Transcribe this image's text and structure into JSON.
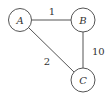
{
  "graph": {
    "nodes": [
      {
        "id": "A",
        "label": "A",
        "cx": 20,
        "cy": 20
      },
      {
        "id": "B",
        "label": "B",
        "cx": 83,
        "cy": 20
      },
      {
        "id": "C",
        "label": "C",
        "cx": 83,
        "cy": 80
      }
    ],
    "edges": [
      {
        "from": "A",
        "to": "B",
        "weight": "1"
      },
      {
        "from": "A",
        "to": "C",
        "weight": "2"
      },
      {
        "from": "B",
        "to": "C",
        "weight": "10"
      }
    ]
  },
  "colors": {
    "stroke": "#555555",
    "text": "#333333",
    "background": "#ffffff"
  }
}
